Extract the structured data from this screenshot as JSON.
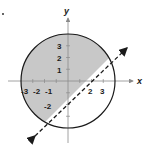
{
  "diagram": {
    "axes": {
      "x_label": "x",
      "y_label": "y",
      "x_ticks": [
        {
          "value": -3,
          "label": "-3"
        },
        {
          "value": -2,
          "label": "-2"
        },
        {
          "value": -1,
          "label": "-1"
        },
        {
          "value": 2,
          "label": "2"
        },
        {
          "value": 3,
          "label": "3"
        }
      ],
      "y_ticks": [
        {
          "value": 3,
          "label": "3"
        },
        {
          "value": 2,
          "label": "2"
        },
        {
          "value": 1,
          "label": "1"
        },
        {
          "value": -2,
          "label": "-2"
        }
      ]
    },
    "circle": {
      "center": [
        0,
        0
      ],
      "radius": 4,
      "stroke": "#1a1a1a"
    },
    "line": {
      "equation": "y = x - 2",
      "style": "dashed",
      "stroke": "#1a1a1a"
    },
    "shaded_region": {
      "fill": "#c8c8c8",
      "description": "inside circle, above line"
    },
    "corner_mark": "."
  }
}
